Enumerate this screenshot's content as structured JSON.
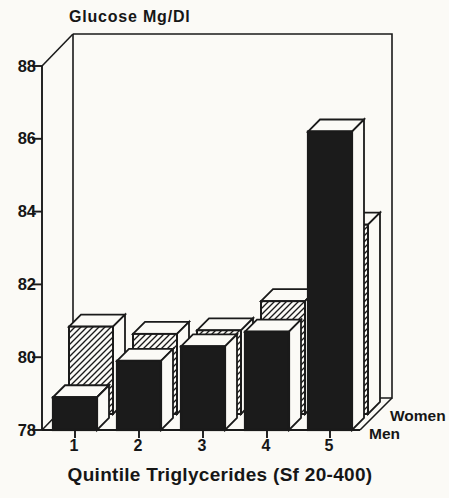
{
  "chart_data": {
    "type": "bar",
    "projection": "3d-rows",
    "title": "Glucose Mg/Dl",
    "xlabel": "Quintile Triglycerides (Sf 20-400)",
    "ylabel": "Glucose Mg/Dl",
    "categories": [
      "1",
      "2",
      "3",
      "4",
      "5"
    ],
    "series": [
      {
        "name": "Men",
        "row": "front",
        "style": "solid-black",
        "values": [
          78.9,
          79.9,
          80.3,
          80.7,
          86.2
        ]
      },
      {
        "name": "Women",
        "row": "back",
        "style": "diagonal-hatch",
        "values": [
          80.4,
          80.2,
          80.3,
          81.1,
          83.2
        ]
      }
    ],
    "ylim": [
      78,
      88
    ],
    "yticks": [
      78,
      80,
      82,
      84,
      86,
      88
    ],
    "grid": false,
    "legend_position": "right-of-front-baseline",
    "colors": {
      "ink": "#1a1a1a",
      "paper": "#fbfaf6",
      "men_bar_fill": "#1b1b1b"
    }
  }
}
